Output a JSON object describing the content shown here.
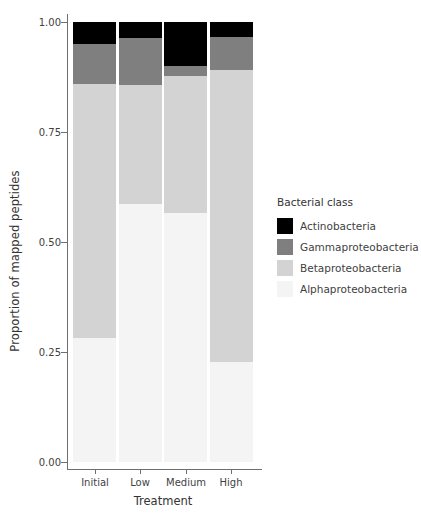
{
  "chart_data": {
    "type": "bar",
    "title": "",
    "subtitle": "",
    "xlabel": "Treatment",
    "ylabel": "Proportion of mapped peptides",
    "categories": [
      "Initial",
      "Low",
      "Medium",
      "High"
    ],
    "ylim": [
      0.0,
      1.0
    ],
    "ytick_labels": [
      "0.00",
      "0.25",
      "0.50",
      "0.75",
      "1.00"
    ],
    "ytick_values": [
      0.0,
      0.25,
      0.5,
      0.75,
      1.0
    ],
    "grid": false,
    "stacked": true,
    "legend_position": "right",
    "legend_title": "Bacterial class",
    "series": [
      {
        "name": "Alphaproteobacteria",
        "color": "#f4f4f4",
        "values": [
          0.282,
          0.586,
          0.566,
          0.227
        ]
      },
      {
        "name": "Betaproteobacteria",
        "color": "#d3d3d3",
        "values": [
          0.577,
          0.27,
          0.311,
          0.664
        ]
      },
      {
        "name": "Gammaproteobacteria",
        "color": "#7f7f7f",
        "values": [
          0.091,
          0.107,
          0.023,
          0.075
        ]
      },
      {
        "name": "Actinobacteria",
        "color": "#000000",
        "values": [
          0.05,
          0.037,
          0.1,
          0.034
        ]
      }
    ],
    "legend_order": [
      "Actinobacteria",
      "Gammaproteobacteria",
      "Betaproteobacteria",
      "Alphaproteobacteria"
    ]
  },
  "axis": {
    "line_color": "#6f6f6f",
    "text_color": "#3f3f3f"
  }
}
